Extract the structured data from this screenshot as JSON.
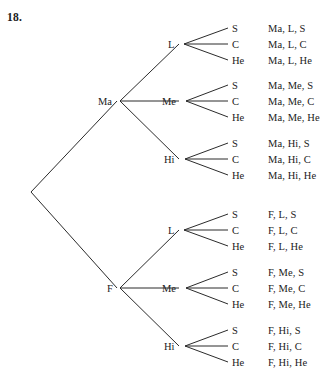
{
  "figure": {
    "exercise_number": "18.",
    "type": "probability-tree-diagram"
  },
  "root": {
    "label": ""
  },
  "level1": [
    {
      "label": "Ma"
    },
    {
      "label": "F"
    }
  ],
  "level2": [
    {
      "label": "L"
    },
    {
      "label": "Me"
    },
    {
      "label": "Hi"
    },
    {
      "label": "L"
    },
    {
      "label": "Me"
    },
    {
      "label": "Hi"
    }
  ],
  "level3": [
    {
      "label": "S"
    },
    {
      "label": "C"
    },
    {
      "label": "He"
    },
    {
      "label": "S"
    },
    {
      "label": "C"
    },
    {
      "label": "He"
    },
    {
      "label": "S"
    },
    {
      "label": "C"
    },
    {
      "label": "He"
    },
    {
      "label": "S"
    },
    {
      "label": "C"
    },
    {
      "label": "He"
    },
    {
      "label": "S"
    },
    {
      "label": "C"
    },
    {
      "label": "He"
    },
    {
      "label": "S"
    },
    {
      "label": "C"
    },
    {
      "label": "He"
    }
  ],
  "outcomes": [
    {
      "text": "Ma, L, S"
    },
    {
      "text": "Ma, L, C"
    },
    {
      "text": "Ma, L, He"
    },
    {
      "text": "Ma, Me, S"
    },
    {
      "text": "Ma, Me, C"
    },
    {
      "text": "Ma, Me, He"
    },
    {
      "text": "Ma, Hi, S"
    },
    {
      "text": "Ma, Hi, C"
    },
    {
      "text": "Ma, Hi, He"
    },
    {
      "text": "F, L, S"
    },
    {
      "text": "F, L, C"
    },
    {
      "text": "F, L, He"
    },
    {
      "text": "F, Me, S"
    },
    {
      "text": "F, Me, C"
    },
    {
      "text": "F, Me, He"
    },
    {
      "text": "F, Hi, S"
    },
    {
      "text": "F, Hi, C"
    },
    {
      "text": "F, Hi, He"
    }
  ],
  "colors": {
    "background": "#ffffff",
    "ink": "#1b1b1b",
    "line": "#2b2b2b"
  }
}
